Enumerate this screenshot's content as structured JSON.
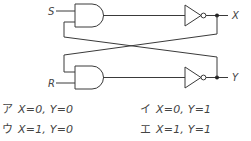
{
  "circuit": {
    "inputs": [
      {
        "label": "S"
      },
      {
        "label": "R"
      }
    ],
    "outputs": [
      {
        "label": "X"
      },
      {
        "label": "Y"
      }
    ],
    "gates": [
      "AND",
      "AND",
      "NOT",
      "NOT"
    ]
  },
  "options": [
    {
      "mark": "ア",
      "text": "X=0, Y=0"
    },
    {
      "mark": "イ",
      "text": "X=0, Y=1"
    },
    {
      "mark": "ウ",
      "text": "X=1, Y=0"
    },
    {
      "mark": "エ",
      "text": "X=1, Y=1"
    }
  ]
}
